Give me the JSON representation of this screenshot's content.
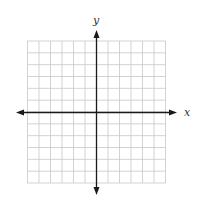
{
  "figure": {
    "type": "coordinate-plane",
    "x_axis_label": "x",
    "y_axis_label": "y",
    "grid": {
      "columns": 12,
      "rows": 12,
      "columns_left_of_y_axis": 6,
      "columns_right_of_y_axis": 6,
      "rows_above_x_axis": 6,
      "rows_below_x_axis": 6
    },
    "colors": {
      "grid_line": "#c8c8c8",
      "axis_line": "#1a1a1a",
      "background": "#ffffff"
    }
  }
}
